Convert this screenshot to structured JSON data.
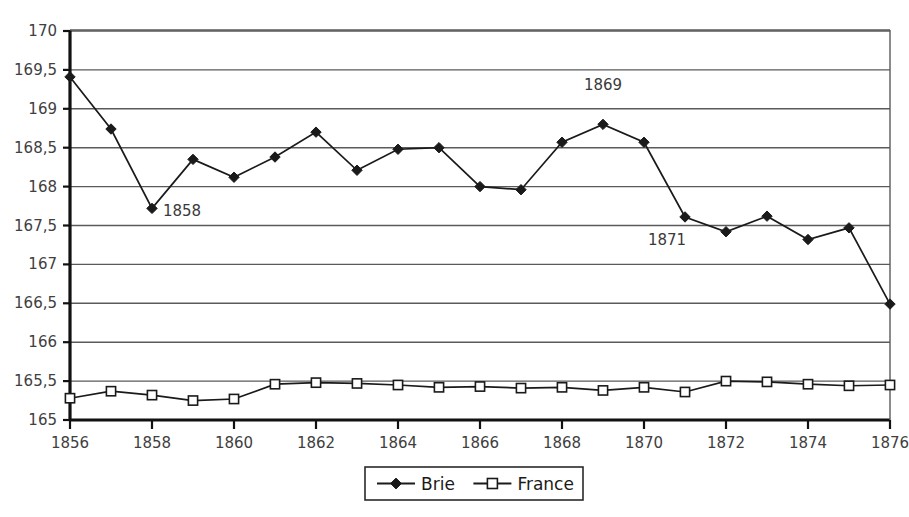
{
  "chart_data": {
    "type": "line",
    "title": "",
    "subtitle": "",
    "xlabel": "",
    "ylabel": "",
    "x": [
      1856,
      1857,
      1858,
      1859,
      1860,
      1861,
      1862,
      1863,
      1864,
      1865,
      1866,
      1867,
      1868,
      1869,
      1870,
      1871,
      1872,
      1873,
      1874,
      1875,
      1876
    ],
    "xlim": [
      1856,
      1876
    ],
    "ylim": [
      165,
      170
    ],
    "grid": true,
    "legend_position": "bottom",
    "x_tick_labels": [
      "1856",
      "1858",
      "1860",
      "1862",
      "1864",
      "1866",
      "1868",
      "1870",
      "1872",
      "1874",
      "1876"
    ],
    "x_tick_values": [
      1856,
      1858,
      1860,
      1862,
      1864,
      1866,
      1868,
      1870,
      1872,
      1874,
      1876
    ],
    "y_tick_labels": [
      "165",
      "165,5",
      "166",
      "166,5",
      "167",
      "167,5",
      "168",
      "168,5",
      "169",
      "169,5",
      "170"
    ],
    "y_tick_values": [
      165,
      165.5,
      166,
      166.5,
      167,
      167.5,
      168,
      168.5,
      169,
      169.5,
      170
    ],
    "series": [
      {
        "name": "Brie",
        "marker": "filled-diamond",
        "color": "#1a1a1a",
        "values": [
          169.41,
          168.74,
          167.72,
          168.35,
          168.12,
          168.38,
          168.7,
          168.21,
          168.48,
          168.5,
          168.0,
          167.96,
          168.57,
          168.8,
          168.57,
          167.61,
          167.42,
          167.62,
          167.32,
          167.47,
          166.49
        ]
      },
      {
        "name": "France",
        "marker": "open-square",
        "color": "#1a1a1a",
        "values": [
          165.28,
          165.37,
          165.32,
          165.25,
          165.27,
          165.46,
          165.48,
          165.47,
          165.45,
          165.42,
          165.43,
          165.41,
          165.42,
          165.38,
          165.42,
          165.36,
          165.5,
          165.49,
          165.46,
          165.44,
          165.45
        ]
      }
    ],
    "annotations": [
      {
        "text": "1858",
        "x": 1858,
        "y": 167.72,
        "dx": 30,
        "dy": 8
      },
      {
        "text": "1869",
        "x": 1869,
        "y": 168.8,
        "dx": 0,
        "dy": -34
      },
      {
        "text": "1871",
        "x": 1871,
        "y": 167.61,
        "dx": -18,
        "dy": 28
      }
    ]
  },
  "legend": {
    "entries": [
      {
        "label": "Brie",
        "marker": "filled-diamond"
      },
      {
        "label": "France",
        "marker": "open-square"
      }
    ]
  }
}
